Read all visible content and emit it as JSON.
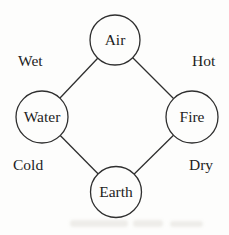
{
  "diagram": {
    "type": "graph",
    "nodes": [
      {
        "id": "air",
        "label": "Air",
        "position": "top"
      },
      {
        "id": "water",
        "label": "Water",
        "position": "left"
      },
      {
        "id": "fire",
        "label": "Fire",
        "position": "right"
      },
      {
        "id": "earth",
        "label": "Earth",
        "position": "bottom"
      }
    ],
    "edges": [
      {
        "from": "air",
        "to": "water"
      },
      {
        "from": "air",
        "to": "fire"
      },
      {
        "from": "water",
        "to": "earth"
      },
      {
        "from": "fire",
        "to": "earth"
      }
    ],
    "qualities": [
      {
        "label": "Wet",
        "position": "top-left"
      },
      {
        "label": "Hot",
        "position": "top-right"
      },
      {
        "label": "Cold",
        "position": "bottom-left"
      },
      {
        "label": "Dry",
        "position": "bottom-right"
      }
    ],
    "colors": {
      "background": "#fdfdfc",
      "stroke": "#2f2f2f",
      "text": "#1e1e1e",
      "node_fill": "#fdfdfc"
    }
  }
}
